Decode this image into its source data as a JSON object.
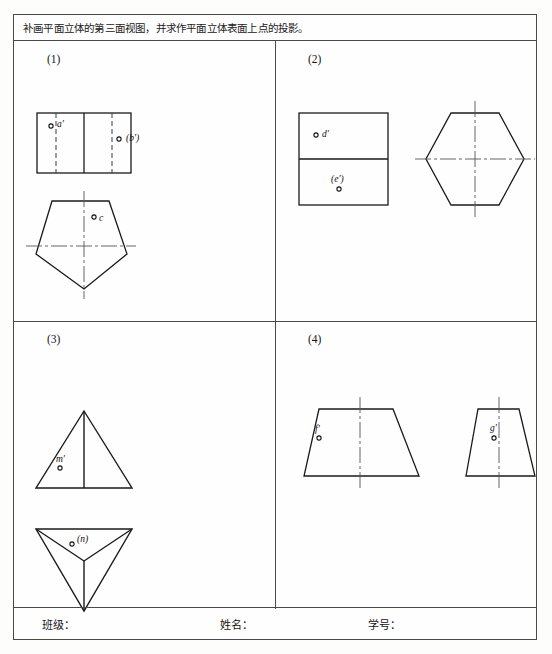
{
  "worksheet": {
    "title": "补画平面立体的第三面视图，并求作平面立体表面上点的投影。",
    "footer": {
      "class_label": "班级：",
      "name_label": "姓名：",
      "student_id_label": "学号："
    }
  },
  "problems": [
    {
      "number": "(1)",
      "solid": "pentagonal-prism",
      "views": [
        {
          "view_name": "front-view-rectangle",
          "shape": "rectangle",
          "points": [
            {
              "label": "a'",
              "visible": true
            },
            {
              "label": "(b')",
              "visible": false
            }
          ]
        },
        {
          "view_name": "top-view-pentagon",
          "shape": "pentagon",
          "points": [
            {
              "label": "c",
              "visible": true
            }
          ]
        }
      ]
    },
    {
      "number": "(2)",
      "solid": "hexagonal-prism",
      "views": [
        {
          "view_name": "front-view-rectangle",
          "shape": "rectangle-split",
          "points": [
            {
              "label": "d'",
              "visible": true
            },
            {
              "label": "(e')",
              "visible": false
            }
          ]
        },
        {
          "view_name": "top-view-hexagon",
          "shape": "hexagon",
          "points": []
        }
      ]
    },
    {
      "number": "(3)",
      "solid": "triangular-pyramid",
      "views": [
        {
          "view_name": "front-view-triangle",
          "shape": "triangle",
          "points": [
            {
              "label": "m'",
              "visible": true
            }
          ]
        },
        {
          "view_name": "top-view-inverted-triangle",
          "shape": "inverted-triangle-with-edges",
          "points": [
            {
              "label": "(n)",
              "visible": false
            }
          ]
        }
      ]
    },
    {
      "number": "(4)",
      "solid": "truncated-pyramid",
      "views": [
        {
          "view_name": "front-view-trapezoid",
          "shape": "trapezoid-wide",
          "points": [
            {
              "label": "f'",
              "visible": true
            }
          ]
        },
        {
          "view_name": "side-view-trapezoid",
          "shape": "trapezoid-narrow",
          "points": [
            {
              "label": "g'",
              "visible": true
            }
          ]
        }
      ]
    }
  ],
  "style": {
    "outline_color": "#1a1a1a",
    "centerline_color": "#555555",
    "frame_color": "#4a4a4a"
  }
}
